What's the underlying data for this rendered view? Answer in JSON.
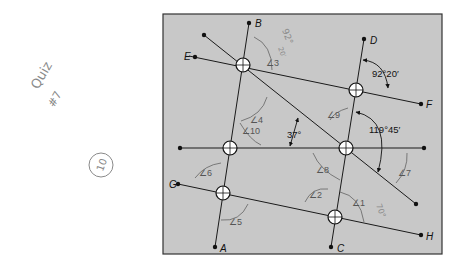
{
  "diagram": {
    "frame": {
      "x": 163,
      "y": 14,
      "width": 279,
      "height": 240,
      "fill": "#c8c8c8",
      "stroke": "#333333"
    },
    "point_labels": {
      "A": "A",
      "B": "B",
      "C": "C",
      "D": "D",
      "E": "E",
      "F": "F",
      "G": "G",
      "H": "H"
    },
    "given_angles": {
      "top_right": "92°20′",
      "center": "37°",
      "right": "119°45′"
    },
    "angle_labels": [
      "∠1",
      "∠2",
      "∠3",
      "∠4",
      "∠5",
      "∠6",
      "∠7",
      "∠8",
      "∠9",
      "∠10"
    ],
    "handwriting": {
      "quiz_title": "Quiz",
      "quiz_number": "#7",
      "score": "10",
      "answer_3": "92°",
      "answer_3b": "20′",
      "answer_1": "70°"
    }
  }
}
